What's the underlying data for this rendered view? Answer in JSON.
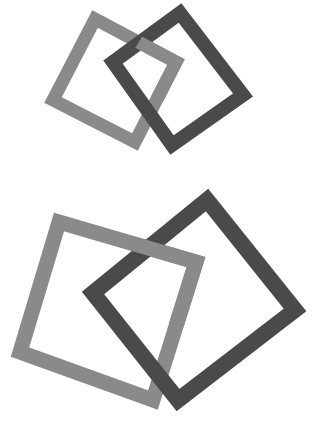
{
  "canvas": {
    "width": 312,
    "height": 424,
    "background_color": "#ffffff",
    "title": "Two interlocking square pairs"
  },
  "palette": {
    "light_gray": "#8a8a8a",
    "dark_gray": "#4a4a4a",
    "background": "#ffffff"
  },
  "figures": [
    {
      "id": "figure-top",
      "name": "top-interlocking-pair",
      "description": "Small pair of interlocked square outlines, upper area",
      "shapes": [
        {
          "id": "top-light-square",
          "name": "light-gray-square",
          "color": "#8a8a8a",
          "stroke_width": 13,
          "rotation_deg": 27,
          "vertices": [
            {
              "x": 95,
              "y": 19
            },
            {
              "x": 176,
              "y": 62
            },
            {
              "x": 135,
              "y": 142
            },
            {
              "x": 53,
              "y": 100
            }
          ]
        },
        {
          "id": "top-dark-square",
          "name": "dark-gray-square",
          "color": "#4a4a4a",
          "stroke_width": 14,
          "rotation_deg": 52,
          "vertices": [
            {
              "x": 180,
              "y": 13
            },
            {
              "x": 243,
              "y": 95
            },
            {
              "x": 172,
              "y": 145
            },
            {
              "x": 113,
              "y": 62
            }
          ]
        }
      ]
    },
    {
      "id": "figure-bottom",
      "name": "bottom-interlocking-pair",
      "description": "Large pair of interlocked square outlines, lower area",
      "shapes": [
        {
          "id": "bottom-light-square",
          "name": "light-gray-square",
          "color": "#8a8a8a",
          "stroke_width": 15,
          "rotation_deg": 28,
          "vertices": [
            {
              "x": 59,
              "y": 222
            },
            {
              "x": 196,
              "y": 262
            },
            {
              "x": 153,
              "y": 400
            },
            {
              "x": 20,
              "y": 352
            }
          ]
        },
        {
          "id": "bottom-dark-square",
          "name": "dark-gray-square",
          "color": "#4a4a4a",
          "stroke_width": 16,
          "rotation_deg": 50,
          "vertices": [
            {
              "x": 207,
              "y": 200
            },
            {
              "x": 295,
              "y": 310
            },
            {
              "x": 178,
              "y": 400
            },
            {
              "x": 93,
              "y": 293
            }
          ]
        }
      ]
    }
  ]
}
